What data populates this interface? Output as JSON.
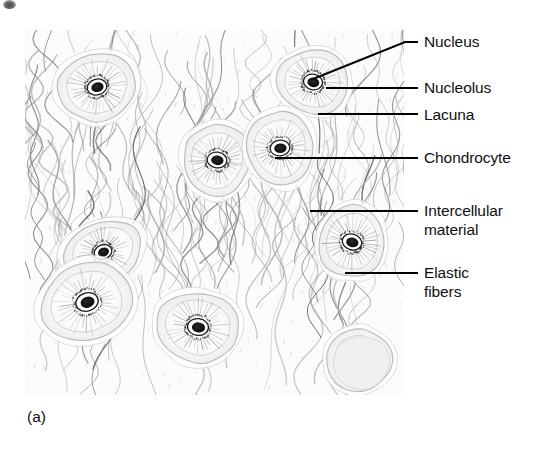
{
  "figure": {
    "caption": "(a)",
    "panel_label": "(a)",
    "colors": {
      "ink": "#111111",
      "leader_line": "#000000",
      "background": "#ffffff",
      "matrix_light": "#f4f4f4",
      "fiber_dark": "#6b6b6b",
      "nucleus_dark": "#111111"
    }
  },
  "callouts": [
    {
      "id": "nucleus",
      "label": "Nucleus",
      "text_x": 424,
      "text_y": 32,
      "leader": {
        "x1": 405,
        "y1": 42,
        "x2": 313,
        "y2": 79,
        "elbow_x": 418
      }
    },
    {
      "id": "nucleolus",
      "label": "Nucleolus",
      "text_x": 424,
      "text_y": 78,
      "leader": {
        "x1": 405,
        "y1": 88,
        "x2": 326,
        "y2": 88,
        "elbow_x": 418
      }
    },
    {
      "id": "lacuna",
      "label": "Lacuna",
      "text_x": 424,
      "text_y": 105,
      "leader": {
        "x1": 405,
        "y1": 114,
        "x2": 318,
        "y2": 114,
        "elbow_x": 418
      }
    },
    {
      "id": "chondrocyte",
      "label": "Chondrocyte",
      "text_x": 424,
      "text_y": 148,
      "leader": {
        "x1": 405,
        "y1": 158,
        "x2": 275,
        "y2": 158,
        "elbow_x": 418
      }
    },
    {
      "id": "intercellular-material",
      "label": "Intercellular\nmaterial",
      "text_x": 424,
      "text_y": 201,
      "leader": {
        "x1": 405,
        "y1": 211,
        "x2": 310,
        "y2": 211,
        "elbow_x": 418
      }
    },
    {
      "id": "elastic-fibers",
      "label": "Elastic\nfibers",
      "text_x": 424,
      "text_y": 263,
      "leader": {
        "x1": 405,
        "y1": 273,
        "x2": 345,
        "y2": 273,
        "elbow_x": 418
      }
    }
  ],
  "micrograph": {
    "panel": {
      "x": 25,
      "y": 30,
      "width": 379,
      "height": 365
    },
    "structures": {
      "chondrocytes": [
        {
          "id": "cell-upper-left",
          "cx": 72,
          "cy": 57,
          "rx": 39,
          "ry": 33,
          "nucleus": true,
          "nucleolus": true,
          "angle": -14
        },
        {
          "id": "cell-upper-mid",
          "cx": 192,
          "cy": 130,
          "rx": 33,
          "ry": 36,
          "nucleus": true,
          "nucleolus": true,
          "angle": 8
        },
        {
          "id": "cell-upper-right",
          "cx": 288,
          "cy": 52,
          "rx": 36,
          "ry": 32,
          "nucleus": true,
          "nucleolus": true,
          "angle": 12
        },
        {
          "id": "cell-right-upper",
          "cx": 255,
          "cy": 118,
          "rx": 33,
          "ry": 37,
          "nucleus": true,
          "nucleolus": true,
          "angle": -6
        },
        {
          "id": "cell-pair-top",
          "cx": 78,
          "cy": 222,
          "rx": 40,
          "ry": 30,
          "nucleus": true,
          "nucleolus": true,
          "angle": -22
        },
        {
          "id": "cell-pair-bottom",
          "cx": 62,
          "cy": 272,
          "rx": 46,
          "ry": 38,
          "nucleus": true,
          "nucleolus": true,
          "angle": -18
        },
        {
          "id": "cell-lower-mid",
          "cx": 173,
          "cy": 297,
          "rx": 41,
          "ry": 35,
          "nucleus": true,
          "nucleolus": true,
          "angle": 6
        },
        {
          "id": "cell-right-mid",
          "cx": 327,
          "cy": 212,
          "rx": 33,
          "ry": 36,
          "nucleus": true,
          "nucleolus": true,
          "angle": 16
        },
        {
          "id": "empty-lacuna",
          "cx": 334,
          "cy": 330,
          "rx": 33,
          "ry": 31,
          "nucleus": false,
          "nucleolus": false,
          "angle": -8
        }
      ],
      "fiber_count": 150,
      "matrix_type": "elastic fibers"
    }
  }
}
